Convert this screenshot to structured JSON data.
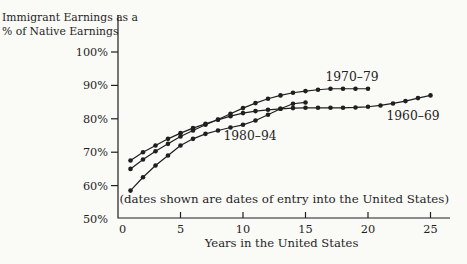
{
  "figure": {
    "title_line1": "Immigrant Earnings as a",
    "title_line2": "% of Native Earnings",
    "note": "(dates shown are dates of entry into the United States)"
  },
  "chart_data": {
    "type": "line",
    "title": "Immigrant Earnings as a % of Native Earnings",
    "xlabel": "Years in the United States",
    "ylabel": "Immigrant Earnings as a % of Native Earnings",
    "xlim": [
      0,
      27
    ],
    "ylim": [
      50,
      100
    ],
    "grid": false,
    "legend": "inline-labels",
    "annotation": "(dates shown are dates of entry into the United States)",
    "x_ticks": [
      0,
      5,
      10,
      15,
      20,
      25
    ],
    "x_tick_labels": [
      "0",
      "5",
      "10",
      "15",
      "20",
      "25"
    ],
    "y_ticks": [
      50,
      60,
      70,
      80,
      90,
      100
    ],
    "y_tick_labels": [
      "50%",
      "60%",
      "70%",
      "80%",
      "90%",
      "100%"
    ],
    "marker": "filled-circle",
    "line_color": "#1f1f1f",
    "series": [
      {
        "name": "1960–69",
        "x": [
          1,
          2,
          3,
          4,
          5,
          6,
          7,
          8,
          9,
          10,
          11,
          12,
          13,
          14,
          15,
          16,
          17,
          18,
          19,
          20,
          21,
          22,
          23,
          24,
          25
        ],
        "values": [
          67.5,
          70,
          72,
          74,
          75.7,
          77.2,
          78.5,
          79.7,
          80.8,
          81.7,
          82.3,
          82.7,
          83,
          83.2,
          83.3,
          83.3,
          83.3,
          83.3,
          83.4,
          83.6,
          84,
          84.6,
          85.3,
          86.2,
          87
        ]
      },
      {
        "name": "1970–79",
        "x": [
          1,
          2,
          3,
          4,
          5,
          6,
          7,
          8,
          9,
          10,
          11,
          12,
          13,
          14,
          15,
          16,
          17,
          18,
          19,
          20
        ],
        "values": [
          65,
          67.8,
          70.3,
          72.5,
          74.7,
          76.5,
          78.2,
          79.8,
          81.5,
          83.2,
          84.7,
          86,
          87,
          87.8,
          88.3,
          88.7,
          89,
          89,
          89,
          89
        ]
      },
      {
        "name": "1980–94",
        "x": [
          1,
          2,
          3,
          4,
          5,
          6,
          7,
          8,
          9,
          10,
          11,
          12,
          13,
          14,
          15
        ],
        "values": [
          58.5,
          62.5,
          66,
          69,
          72,
          74,
          75.5,
          76.5,
          77.4,
          78.2,
          79.5,
          81.2,
          83,
          84.5,
          84.9
        ]
      }
    ]
  }
}
